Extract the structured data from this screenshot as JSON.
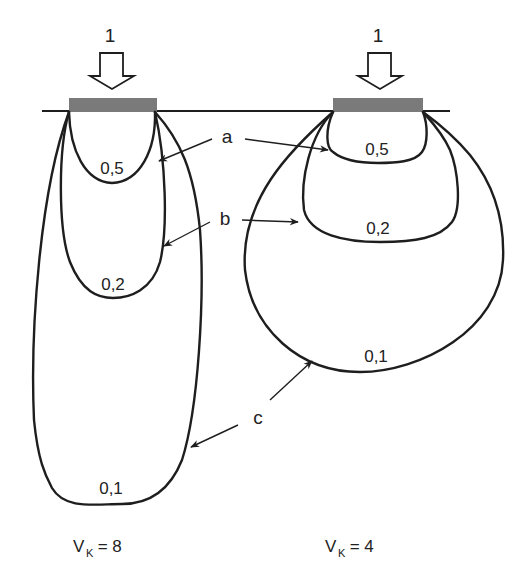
{
  "diagram": {
    "type": "pressure-bulb",
    "colors": {
      "line": "#1e1e1e",
      "footing": "#7a7a7a",
      "background": "#ffffff"
    },
    "panels": [
      {
        "id": "left",
        "load_label": "1",
        "ratio_var": "V",
        "ratio_sub": "K",
        "ratio_eq": " = 8",
        "contours": [
          {
            "id": "a",
            "value_label": "0,5"
          },
          {
            "id": "b",
            "value_label": "0,2"
          },
          {
            "id": "c",
            "value_label": "0,1"
          }
        ]
      },
      {
        "id": "right",
        "load_label": "1",
        "ratio_var": "V",
        "ratio_sub": "K",
        "ratio_eq": " = 4",
        "contours": [
          {
            "id": "a",
            "value_label": "0,5"
          },
          {
            "id": "b",
            "value_label": "0,2"
          },
          {
            "id": "c",
            "value_label": "0,1"
          }
        ]
      }
    ],
    "callouts": [
      {
        "id": "a",
        "label": "a"
      },
      {
        "id": "b",
        "label": "b"
      },
      {
        "id": "c",
        "label": "c"
      }
    ]
  }
}
